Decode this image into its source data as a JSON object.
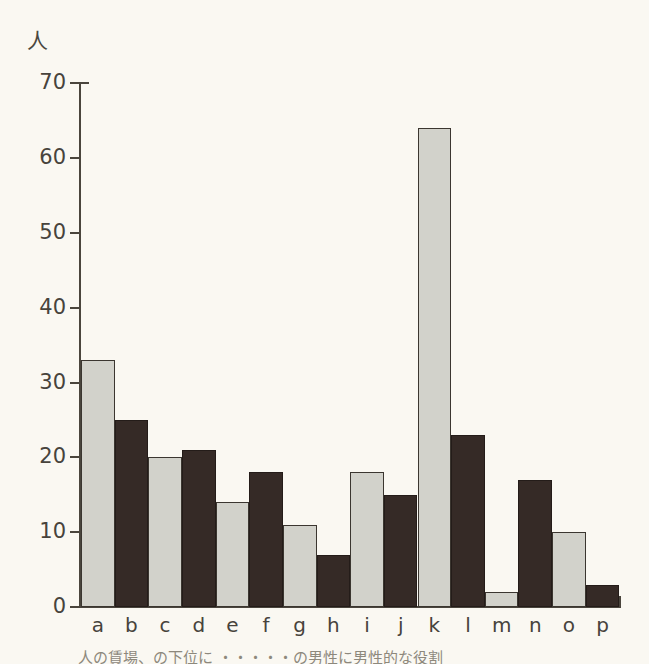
{
  "chart_data": {
    "type": "bar",
    "title": "",
    "subtitle": "",
    "xlabel": "",
    "ylabel": "人",
    "ylim": [
      0,
      70
    ],
    "yticks": [
      0,
      10,
      20,
      30,
      40,
      50,
      60,
      70
    ],
    "grid": false,
    "legend": "none",
    "categories": [
      "a",
      "b",
      "c",
      "d",
      "e",
      "f",
      "g",
      "h",
      "i",
      "j",
      "k",
      "l",
      "m",
      "n",
      "o",
      "p"
    ],
    "values": [
      33,
      25,
      20,
      21,
      14,
      18,
      11,
      7,
      18,
      15,
      64,
      23,
      2,
      17,
      10,
      3
    ],
    "bar_fills": [
      "light",
      "dark",
      "light",
      "dark",
      "light",
      "dark",
      "light",
      "dark",
      "light",
      "dark",
      "light",
      "dark",
      "light",
      "dark",
      "light",
      "dark"
    ],
    "colors": {
      "light_bar": "#d2d2cb",
      "dark_bar": "#352a26",
      "outline": "#3b3630",
      "axis": "#4a453d",
      "background": "#faf8f2",
      "text": "#47433c"
    },
    "annotations": []
  },
  "axis": {
    "unit_label": "人",
    "tick_labels": [
      "70",
      "60",
      "50",
      "40",
      "30",
      "20",
      "10",
      "0"
    ],
    "category_labels": [
      "a",
      "b",
      "c",
      "d",
      "e",
      "f",
      "g",
      "h",
      "i",
      "j",
      "k",
      "l",
      "m",
      "n",
      "o",
      "p"
    ]
  },
  "caption": {
    "text": "人の賃場、の下位に   ・・・・・の男性に男性的な役割"
  }
}
